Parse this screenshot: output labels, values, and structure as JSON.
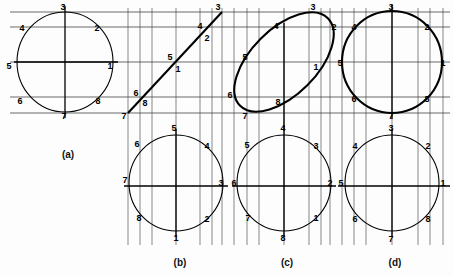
{
  "figure": {
    "background_color": "#fdfdfd",
    "line_color": "#000000",
    "grid_color": "#2a2a2a",
    "width": 453,
    "height": 276
  },
  "captions": [
    {
      "id": "a",
      "label": "(a)",
      "x": 68,
      "y": 158
    },
    {
      "id": "b",
      "label": "(b)",
      "x": 180,
      "y": 266
    },
    {
      "id": "c",
      "label": "(c)",
      "x": 287,
      "y": 266
    },
    {
      "id": "d",
      "label": "(d)",
      "x": 395,
      "y": 266
    }
  ],
  "panels": [
    {
      "id": "a",
      "caption": "(a)",
      "views": [
        {
          "name": "front-view",
          "shape": "circle",
          "stroke": "thin",
          "center": [
            65,
            62
          ],
          "radius_x": 48,
          "radius_y": 50,
          "rotation_deg": 0,
          "points": [
            {
              "label": "1",
              "x": 110,
              "y": 69
            },
            {
              "label": "2",
              "x": 97,
              "y": 31
            },
            {
              "label": "3",
              "x": 63,
              "y": 10
            },
            {
              "label": "4",
              "x": 22,
              "y": 31
            },
            {
              "label": "5",
              "x": 9,
              "y": 69
            },
            {
              "label": "6",
              "x": 20,
              "y": 104
            },
            {
              "label": "7",
              "x": 64,
              "y": 119
            },
            {
              "label": "8",
              "x": 98,
              "y": 104
            }
          ]
        }
      ]
    },
    {
      "id": "b",
      "caption": "(b)",
      "views": [
        {
          "name": "top-view-edge",
          "shape": "line",
          "stroke": "thin",
          "from": [
            128,
            113
          ],
          "to": [
            222,
            12
          ],
          "points": [
            {
              "label": "1",
              "x": 178,
              "y": 72
            },
            {
              "label": "2",
              "x": 207,
              "y": 41
            },
            {
              "label": "3",
              "x": 218,
              "y": 10
            },
            {
              "label": "4",
              "x": 200,
              "y": 29
            },
            {
              "label": "5",
              "x": 170,
              "y": 60
            },
            {
              "label": "6",
              "x": 136,
              "y": 96
            },
            {
              "label": "7",
              "x": 124,
              "y": 119
            },
            {
              "label": "8",
              "x": 145,
              "y": 106
            }
          ]
        },
        {
          "name": "auxiliary-view",
          "shape": "circle",
          "stroke": "thin",
          "center": [
            176,
            183
          ],
          "radius_x": 47,
          "radius_y": 48,
          "rotation_deg": 0,
          "points": [
            {
              "label": "1",
              "x": 176,
              "y": 241
            },
            {
              "label": "2",
              "x": 207,
              "y": 222
            },
            {
              "label": "3",
              "x": 221,
              "y": 186
            },
            {
              "label": "4",
              "x": 207,
              "y": 149
            },
            {
              "label": "5",
              "x": 174,
              "y": 131
            },
            {
              "label": "6",
              "x": 137,
              "y": 147
            },
            {
              "label": "7",
              "x": 125,
              "y": 183
            },
            {
              "label": "8",
              "x": 139,
              "y": 221
            }
          ]
        }
      ]
    },
    {
      "id": "c",
      "caption": "(c)",
      "views": [
        {
          "name": "front-view-ellipse",
          "shape": "ellipse",
          "stroke": "bold",
          "center": [
            284,
            62
          ],
          "radius_x": 62,
          "radius_y": 33,
          "rotation_deg": -45,
          "points": [
            {
              "label": "1",
              "x": 316,
              "y": 70
            },
            {
              "label": "2",
              "x": 334,
              "y": 30
            },
            {
              "label": "3",
              "x": 313,
              "y": 10
            },
            {
              "label": "4",
              "x": 276,
              "y": 29
            },
            {
              "label": "5",
              "x": 245,
              "y": 60
            },
            {
              "label": "6",
              "x": 230,
              "y": 98
            },
            {
              "label": "7",
              "x": 245,
              "y": 119
            },
            {
              "label": "8",
              "x": 278,
              "y": 105
            }
          ]
        },
        {
          "name": "auxiliary-view",
          "shape": "circle",
          "stroke": "thin",
          "center": [
            284,
            183
          ],
          "radius_x": 47,
          "radius_y": 48,
          "rotation_deg": 0,
          "points": [
            {
              "label": "1",
              "x": 316,
              "y": 221
            },
            {
              "label": "2",
              "x": 330,
              "y": 186
            },
            {
              "label": "3",
              "x": 316,
              "y": 149
            },
            {
              "label": "4",
              "x": 283,
              "y": 131
            },
            {
              "label": "5",
              "x": 247,
              "y": 148
            },
            {
              "label": "6",
              "x": 234,
              "y": 186
            },
            {
              "label": "7",
              "x": 248,
              "y": 221
            },
            {
              "label": "8",
              "x": 283,
              "y": 241
            }
          ]
        }
      ]
    },
    {
      "id": "d",
      "caption": "(d)",
      "views": [
        {
          "name": "front-view-circle",
          "shape": "circle",
          "stroke": "bold",
          "center": [
            392,
            62
          ],
          "radius_x": 50,
          "radius_y": 51,
          "rotation_deg": 0,
          "points": [
            {
              "label": "1",
              "x": 443,
              "y": 66
            },
            {
              "label": "2",
              "x": 427,
              "y": 30
            },
            {
              "label": "3",
              "x": 391,
              "y": 10
            },
            {
              "label": "4",
              "x": 354,
              "y": 30
            },
            {
              "label": "5",
              "x": 340,
              "y": 66
            },
            {
              "label": "6",
              "x": 354,
              "y": 102
            },
            {
              "label": "7",
              "x": 391,
              "y": 119
            },
            {
              "label": "8",
              "x": 427,
              "y": 102
            }
          ]
        },
        {
          "name": "auxiliary-view",
          "shape": "circle",
          "stroke": "thin",
          "center": [
            392,
            183
          ],
          "radius_x": 47,
          "radius_y": 48,
          "rotation_deg": 0,
          "points": [
            {
              "label": "1",
              "x": 443,
              "y": 186
            },
            {
              "label": "2",
              "x": 428,
              "y": 149
            },
            {
              "label": "3",
              "x": 391,
              "y": 131
            },
            {
              "label": "4",
              "x": 355,
              "y": 149
            },
            {
              "label": "5",
              "x": 341,
              "y": 186
            },
            {
              "label": "6",
              "x": 355,
              "y": 222
            },
            {
              "label": "7",
              "x": 391,
              "y": 242
            },
            {
              "label": "8",
              "x": 428,
              "y": 222
            }
          ]
        }
      ]
    }
  ],
  "grid": {
    "top_horizontals": [
      12,
      27,
      62,
      97,
      113
    ],
    "bottom_horizontals": [
      186
    ],
    "verticals_top": [
      128,
      140,
      152,
      176,
      200,
      212,
      222,
      234,
      247,
      259,
      284,
      309,
      321,
      330,
      342,
      354,
      366,
      392,
      418,
      430,
      443
    ],
    "verticals_bottom": [
      128,
      140,
      152,
      176,
      200,
      212,
      222,
      234,
      247,
      259,
      284,
      309,
      321,
      330,
      342,
      354,
      366,
      392,
      418,
      430,
      443
    ]
  }
}
